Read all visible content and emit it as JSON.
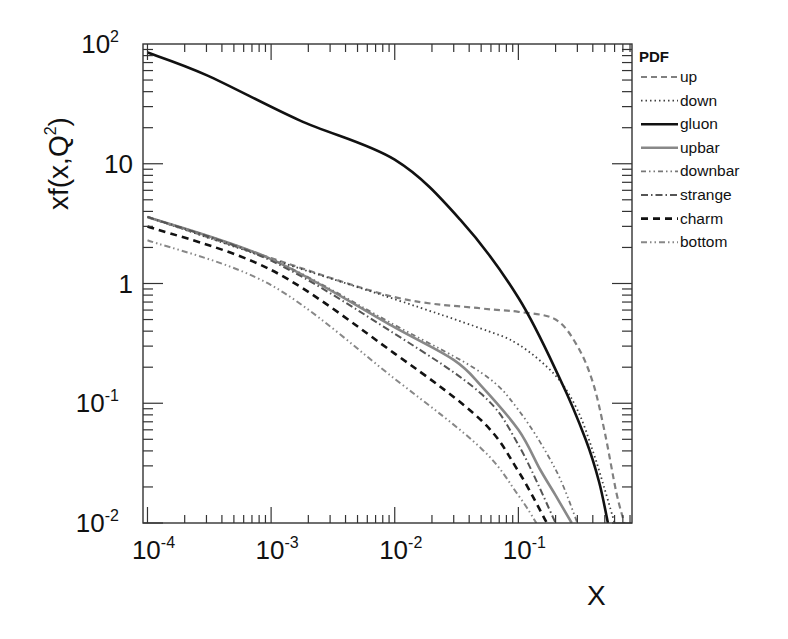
{
  "chart_data": {
    "type": "line",
    "title": "",
    "xlabel": "X",
    "ylabel": "xf(x,Q^2)",
    "xscale": "log",
    "yscale": "log",
    "xlim": [
      9.2e-05,
      0.83
    ],
    "ylim": [
      0.01,
      100
    ],
    "grid": false,
    "legend_position": "right-outside",
    "legend_title": "PDF",
    "x_ticks": [
      {
        "value": 0.0001,
        "base": "10",
        "exp": "-4"
      },
      {
        "value": 0.001,
        "base": "10",
        "exp": "-3"
      },
      {
        "value": 0.01,
        "base": "10",
        "exp": "-2"
      },
      {
        "value": 0.1,
        "base": "10",
        "exp": "-1"
      }
    ],
    "y_ticks": [
      {
        "value": 0.01,
        "base": "10",
        "exp": "-2"
      },
      {
        "value": 0.1,
        "base": "10",
        "exp": "-1"
      },
      {
        "value": 1,
        "base": "1",
        "exp": ""
      },
      {
        "value": 10,
        "base": "10",
        "exp": ""
      },
      {
        "value": 100,
        "base": "10",
        "exp": "2"
      }
    ],
    "series": [
      {
        "name": "up",
        "color": "#808080",
        "width": 2.2,
        "dash": "6 4",
        "x": [
          0.0001,
          0.001,
          0.01,
          0.05,
          0.1,
          0.2,
          0.3,
          0.4,
          0.5,
          0.62,
          0.72
        ],
        "y": [
          3.6,
          1.63,
          0.77,
          0.62,
          0.58,
          0.5,
          0.3,
          0.15,
          0.057,
          0.018,
          0.01
        ]
      },
      {
        "name": "down",
        "color": "#404040",
        "width": 1.8,
        "dash": "1.5 3",
        "x": [
          0.0001,
          0.001,
          0.01,
          0.05,
          0.1,
          0.2,
          0.3,
          0.4,
          0.5,
          0.6
        ],
        "y": [
          3.6,
          1.6,
          0.74,
          0.42,
          0.31,
          0.17,
          0.088,
          0.04,
          0.019,
          0.01
        ]
      },
      {
        "name": "gluon",
        "color": "#111111",
        "width": 2.6,
        "dash": "",
        "x": [
          0.0001,
          0.0003,
          0.0017,
          0.01,
          0.034,
          0.1,
          0.22,
          0.35,
          0.45,
          0.53
        ],
        "y": [
          85,
          55,
          23,
          10.8,
          3.4,
          0.76,
          0.155,
          0.05,
          0.022,
          0.01
        ]
      },
      {
        "name": "upbar",
        "color": "#888888",
        "width": 2.6,
        "dash": "",
        "x": [
          0.0001,
          0.001,
          0.01,
          0.03,
          0.05,
          0.1,
          0.15,
          0.2,
          0.27
        ],
        "y": [
          3.6,
          1.6,
          0.43,
          0.23,
          0.14,
          0.06,
          0.028,
          0.017,
          0.01
        ]
      },
      {
        "name": "downbar",
        "color": "#777777",
        "width": 1.8,
        "dash": "5 3 1.5 3 1.5 3",
        "x": [
          0.0001,
          0.001,
          0.01,
          0.05,
          0.1,
          0.2,
          0.3
        ],
        "y": [
          3.6,
          1.6,
          0.45,
          0.18,
          0.088,
          0.028,
          0.01
        ]
      },
      {
        "name": "strange",
        "color": "#555555",
        "width": 2.0,
        "dash": "7 3 1.5 3",
        "x": [
          0.0001,
          0.001,
          0.01,
          0.05,
          0.1,
          0.2
        ],
        "y": [
          3.6,
          1.55,
          0.38,
          0.12,
          0.045,
          0.01
        ]
      },
      {
        "name": "charm",
        "color": "#111111",
        "width": 2.6,
        "dash": "7 5",
        "x": [
          0.0001,
          0.001,
          0.01,
          0.05,
          0.1,
          0.17
        ],
        "y": [
          3.0,
          1.3,
          0.26,
          0.072,
          0.027,
          0.01
        ]
      },
      {
        "name": "bottom",
        "color": "#888888",
        "width": 2.0,
        "dash": "6 3 1.5 3 1.5 3",
        "x": [
          0.0001,
          0.001,
          0.01,
          0.05,
          0.1,
          0.14
        ],
        "y": [
          2.3,
          0.97,
          0.16,
          0.042,
          0.017,
          0.01
        ]
      }
    ]
  },
  "labels": {
    "y_axis_title": "xf(x,Q",
    "y_axis_sup": "2",
    "y_axis_close": ")",
    "x_axis_title": "X",
    "legend_title": "PDF"
  }
}
